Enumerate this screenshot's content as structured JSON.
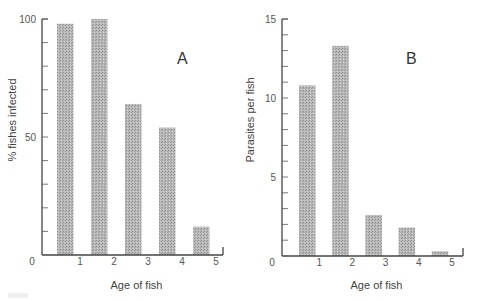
{
  "chart_data": [
    {
      "type": "bar",
      "panel_label": "A",
      "title": "",
      "xlabel": "Age of fish",
      "ylabel": "% fishes infected",
      "x_ticks": [
        "0",
        "1",
        "2",
        "3",
        "4",
        "5"
      ],
      "y_ticks": [
        "0",
        "50",
        "100"
      ],
      "ylim": [
        0,
        100
      ],
      "xlim": [
        0,
        5
      ],
      "categories": [
        "0-1",
        "1-2",
        "2-3",
        "3-4",
        "4-5"
      ],
      "values": [
        98,
        100,
        64,
        54,
        12
      ],
      "grid": false,
      "legend": null
    },
    {
      "type": "bar",
      "panel_label": "B",
      "title": "",
      "xlabel": "Age of fish",
      "ylabel": "Parasites per fish",
      "x_ticks": [
        "0",
        "1",
        "2",
        "3",
        "4",
        "5"
      ],
      "y_ticks": [
        "0",
        "5",
        "10",
        "15"
      ],
      "ylim": [
        0,
        15
      ],
      "xlim": [
        0,
        5
      ],
      "categories": [
        "0-1",
        "1-2",
        "2-3",
        "3-4",
        "4-5"
      ],
      "values": [
        10.8,
        13.3,
        2.6,
        1.8,
        0.3
      ],
      "grid": false,
      "legend": null
    }
  ],
  "colors": {
    "bar_fill": "#a8a8a8",
    "axis": "#444444",
    "background": "#ffffff"
  }
}
